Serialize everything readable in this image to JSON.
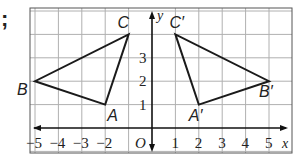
{
  "prefix_mark": ";",
  "graph": {
    "origin_label": "O",
    "x_axis_label": "x",
    "y_axis_label": "y",
    "x_ticks": [
      -5,
      -4,
      -3,
      -2,
      1,
      2,
      3,
      4,
      5
    ],
    "x_tick_labels": [
      "−5",
      "−4",
      "−3",
      "−2",
      "1",
      "2",
      "3",
      "4",
      "5"
    ],
    "y_ticks": [
      1,
      2,
      3
    ],
    "y_tick_labels": [
      "1",
      "2",
      "3"
    ],
    "grid": {
      "x_min": -5.2,
      "x_max": 5.8,
      "y_min": -1,
      "y_max": 5,
      "unit_px": 23.4,
      "origin_px": [
        152,
        128
      ]
    },
    "colors": {
      "grid": "#b0b0b0",
      "axis": "#111111",
      "shape": "#1a1a1a",
      "border": "#555555"
    },
    "triangles": [
      {
        "name": "ABC",
        "vertices": [
          {
            "label": "A",
            "x": -2,
            "y": 1
          },
          {
            "label": "B",
            "x": -5,
            "y": 2
          },
          {
            "label": "C",
            "x": -1,
            "y": 4
          }
        ]
      },
      {
        "name": "A'B'C'",
        "vertices": [
          {
            "label": "A′",
            "x": 2,
            "y": 1
          },
          {
            "label": "B′",
            "x": 5,
            "y": 2
          },
          {
            "label": "C′",
            "x": 1,
            "y": 4
          }
        ]
      }
    ]
  }
}
